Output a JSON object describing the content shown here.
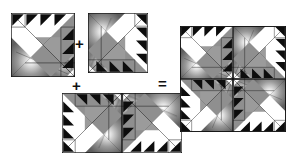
{
  "figure": {
    "type": "quilt-block-assembly-diagram",
    "background_color": "#ffffff",
    "line_color": "#111111"
  },
  "operators": [
    {
      "id": "plus-1",
      "symbol": "+",
      "x": 75,
      "y": 36
    },
    {
      "id": "plus-2",
      "symbol": "+",
      "x": 72,
      "y": 78
    },
    {
      "id": "equals-1",
      "symbol": "=",
      "x": 158,
      "y": 76
    }
  ],
  "palette": {
    "black": "#0d0d0d",
    "white": "#ffffff",
    "light_gray": "#c9c9c9",
    "mid_gray": "#8f8f8f",
    "dark_gray": "#6a6a6a",
    "outline": "#111111",
    "burst_center": "#ffffff",
    "burst_edge": "#5a5a5a"
  },
  "blocks": [
    {
      "id": "block-1",
      "label": "Block 1",
      "rotation_deg": 0,
      "x": 11,
      "y": 13,
      "size": 64,
      "units": [
        {
          "name": "large-white-triangle",
          "fabric": "white"
        },
        {
          "name": "large-gray-triangle",
          "fabric": "mid_gray"
        },
        {
          "name": "burst-triangle",
          "fabric": "radial-burst"
        },
        {
          "name": "sawtooth-border-top",
          "count": 3,
          "fabric": "black"
        },
        {
          "name": "sawtooth-border-right",
          "count": 3,
          "fabric": "black"
        }
      ]
    },
    {
      "id": "block-2",
      "label": "Block 2",
      "rotation_deg": 90,
      "x": 88,
      "y": 13,
      "size": 60,
      "units": [
        {
          "name": "large-white-triangle",
          "fabric": "white"
        },
        {
          "name": "large-gray-triangle",
          "fabric": "light_gray"
        },
        {
          "name": "burst-triangle",
          "fabric": "radial-burst"
        },
        {
          "name": "sawtooth-border-right",
          "count": 3,
          "fabric": "black"
        },
        {
          "name": "sawtooth-border-bottom",
          "count": 3,
          "fabric": "black"
        }
      ]
    },
    {
      "id": "block-3",
      "label": "Block 3",
      "rotation_deg": 180,
      "x": 62,
      "y": 93,
      "size": 60,
      "units": [
        {
          "name": "large-white-triangle",
          "fabric": "white"
        },
        {
          "name": "large-gray-triangle",
          "fabric": "light_gray"
        },
        {
          "name": "burst-triangle",
          "fabric": "radial-burst"
        },
        {
          "name": "sawtooth-border-left",
          "count": 3,
          "fabric": "black"
        },
        {
          "name": "sawtooth-border-top",
          "count": 3,
          "fabric": "black"
        }
      ]
    },
    {
      "id": "block-4",
      "label": "Block 4",
      "rotation_deg": 270,
      "x": 122,
      "y": 93,
      "size": 60,
      "units": [
        {
          "name": "large-white-triangle",
          "fabric": "white"
        },
        {
          "name": "large-gray-triangle",
          "fabric": "dark_gray"
        },
        {
          "name": "burst-triangle",
          "fabric": "radial-burst"
        },
        {
          "name": "sawtooth-border-bottom",
          "count": 3,
          "fabric": "black"
        },
        {
          "name": "sawtooth-border-left",
          "count": 3,
          "fabric": "black"
        }
      ]
    }
  ],
  "result": {
    "id": "result-quilt",
    "label": "Assembled quilt top",
    "x": 180,
    "y": 26,
    "width": 106,
    "height": 106,
    "grid_rows": 2,
    "grid_cols": 2,
    "cells": [
      {
        "position": "top-left",
        "rotation_deg": 0
      },
      {
        "position": "top-right",
        "rotation_deg": 90
      },
      {
        "position": "bottom-left",
        "rotation_deg": 270
      },
      {
        "position": "bottom-right",
        "rotation_deg": 180
      }
    ]
  }
}
